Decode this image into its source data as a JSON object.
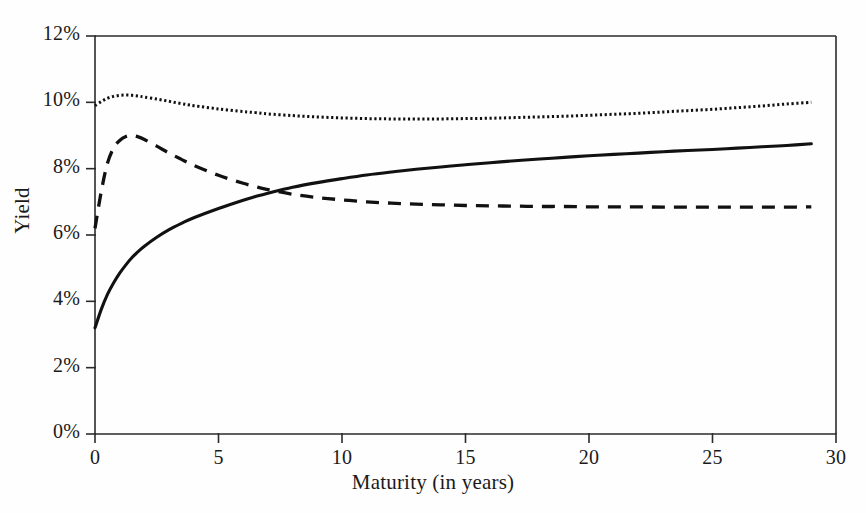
{
  "chart_data": {
    "type": "line",
    "title": "",
    "xlabel": "Maturity (in years)",
    "ylabel": "Yield",
    "xlim": [
      0,
      30
    ],
    "ylim": [
      0,
      12
    ],
    "grid": false,
    "legend_position": "none",
    "xticks": [
      0,
      5,
      10,
      15,
      20,
      25,
      30
    ],
    "xticklabels": [
      "0",
      "5",
      "10",
      "15",
      "20",
      "25",
      "30"
    ],
    "yticks": [
      0,
      2,
      4,
      6,
      8,
      10,
      12
    ],
    "yticklabels": [
      "0%",
      "2%",
      "4%",
      "6%",
      "8%",
      "10%",
      "12%"
    ],
    "x": [
      0,
      0.25,
      0.5,
      0.75,
      1,
      1.25,
      1.5,
      1.75,
      2,
      2.5,
      3,
      3.5,
      4,
      5,
      6,
      6.5,
      7,
      8,
      9,
      10,
      11,
      12,
      13,
      14,
      15,
      16,
      17,
      18,
      19,
      20,
      21,
      22,
      23,
      24,
      25,
      26,
      27,
      28,
      29
    ],
    "series": [
      {
        "name": "rising-yield-curve",
        "style": "solid",
        "values": [
          3.2,
          3.75,
          4.2,
          4.55,
          4.85,
          5.1,
          5.32,
          5.5,
          5.66,
          5.93,
          6.16,
          6.35,
          6.52,
          6.8,
          7.05,
          7.16,
          7.26,
          7.44,
          7.58,
          7.7,
          7.81,
          7.9,
          7.98,
          8.05,
          8.12,
          8.18,
          8.24,
          8.29,
          8.34,
          8.39,
          8.43,
          8.47,
          8.51,
          8.55,
          8.58,
          8.62,
          8.66,
          8.7,
          8.75
        ]
      },
      {
        "name": "humped-yield-curve",
        "style": "dashed",
        "values": [
          6.2,
          7.3,
          8.15,
          8.62,
          8.85,
          8.97,
          9.0,
          8.96,
          8.88,
          8.68,
          8.47,
          8.28,
          8.1,
          7.8,
          7.56,
          7.46,
          7.37,
          7.23,
          7.13,
          7.06,
          7.0,
          6.96,
          6.93,
          6.91,
          6.89,
          6.88,
          6.87,
          6.86,
          6.86,
          6.85,
          6.85,
          6.85,
          6.84,
          6.84,
          6.84,
          6.84,
          6.84,
          6.84,
          6.85
        ]
      },
      {
        "name": "flat-inverted-yield-curve",
        "style": "dotted",
        "values": [
          9.9,
          10.02,
          10.12,
          10.18,
          10.21,
          10.22,
          10.21,
          10.19,
          10.16,
          10.1,
          10.03,
          9.96,
          9.9,
          9.8,
          9.72,
          9.69,
          9.65,
          9.6,
          9.56,
          9.53,
          9.51,
          9.5,
          9.5,
          9.5,
          9.51,
          9.52,
          9.54,
          9.56,
          9.58,
          9.61,
          9.64,
          9.67,
          9.71,
          9.75,
          9.79,
          9.84,
          9.89,
          9.95,
          10.0
        ]
      }
    ]
  },
  "axes": {
    "y_title": "Yield",
    "x_title": "Maturity (in years)"
  },
  "colors": {
    "line": "#111111",
    "axis": "#2b2b2b",
    "background": "#fefefe"
  }
}
